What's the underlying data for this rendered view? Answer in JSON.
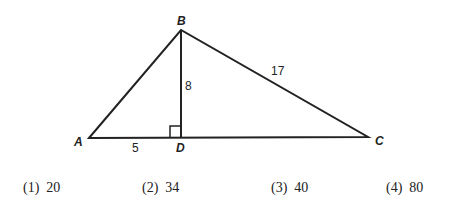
{
  "diagram": {
    "vertices": {
      "A": "A",
      "B": "B",
      "C": "C",
      "D": "D"
    },
    "measures": {
      "AD": "5",
      "BD": "8",
      "BC": "17"
    },
    "right_angle_at": "D"
  },
  "choices": [
    {
      "label": "(1)",
      "value": "20"
    },
    {
      "label": "(2)",
      "value": "34"
    },
    {
      "label": "(3)",
      "value": "40"
    },
    {
      "label": "(4)",
      "value": "80"
    }
  ]
}
